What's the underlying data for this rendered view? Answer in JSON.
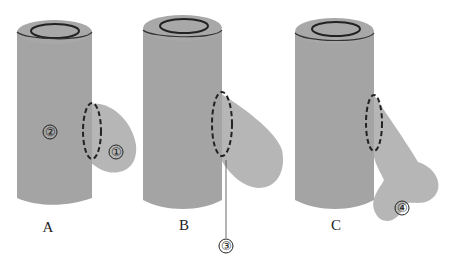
{
  "diagram": {
    "panels": [
      {
        "id": "A",
        "label": "A",
        "marker_main": "②",
        "marker_branch": "①"
      },
      {
        "id": "B",
        "label": "B",
        "callout": "③"
      },
      {
        "id": "C",
        "label": "C",
        "marker_branch": "④"
      }
    ],
    "colors": {
      "trunk": "#a3a3a3",
      "branch": "#b5b5b5",
      "outline": "#2a2a2a",
      "background": "#ffffff"
    }
  }
}
